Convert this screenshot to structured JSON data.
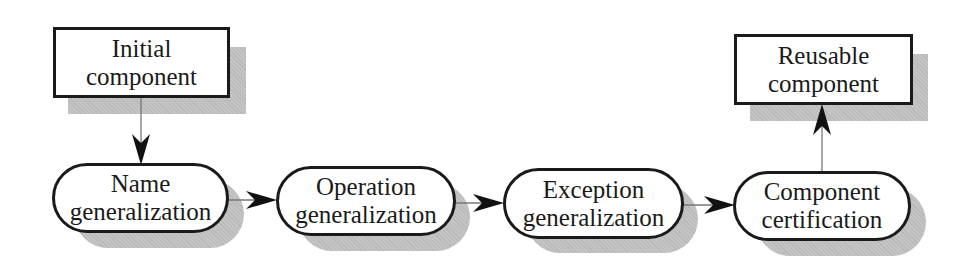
{
  "diagram": {
    "type": "process-flow",
    "nodes": {
      "initial": {
        "id": "initial",
        "shape": "rectangle",
        "line1": "Initial",
        "line2": "component"
      },
      "name_gen": {
        "id": "name_gen",
        "shape": "rounded",
        "line1": "Name",
        "line2": "generalization"
      },
      "operation_gen": {
        "id": "operation_gen",
        "shape": "rounded",
        "line1": "Operation",
        "line2": "generalization"
      },
      "exception_gen": {
        "id": "exception_gen",
        "shape": "rounded",
        "line1": "Exception",
        "line2": "generalization"
      },
      "certification": {
        "id": "certification",
        "shape": "rounded",
        "line1": "Component",
        "line2": "certification"
      },
      "reusable": {
        "id": "reusable",
        "shape": "rectangle",
        "line1": "Reusable",
        "line2": "component"
      }
    },
    "edges": [
      {
        "from": "initial",
        "to": "name_gen"
      },
      {
        "from": "name_gen",
        "to": "operation_gen"
      },
      {
        "from": "operation_gen",
        "to": "exception_gen"
      },
      {
        "from": "exception_gen",
        "to": "certification"
      },
      {
        "from": "certification",
        "to": "reusable"
      }
    ],
    "colors": {
      "border": "#1a1a1a",
      "shadow": "#c4c4c4",
      "connector": "#777777",
      "arrowhead": "#111111",
      "background": "#ffffff"
    }
  }
}
